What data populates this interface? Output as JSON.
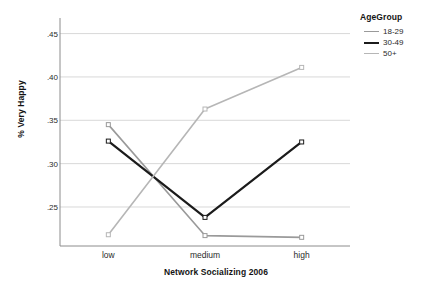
{
  "chart_data": {
    "type": "line",
    "title": "",
    "xlabel": "Network Socializing 2006",
    "ylabel": "% Very Happy",
    "categories": [
      "low",
      "medium",
      "high"
    ],
    "ylim": [
      0.205,
      0.468
    ],
    "yticks": [
      ".25",
      ".30",
      ".35",
      ".40",
      ".45"
    ],
    "ytick_values": [
      0.25,
      0.3,
      0.35,
      0.4,
      0.45
    ],
    "grid": true,
    "legend_position": "top-right",
    "legend_title": "AgeGroup",
    "series": [
      {
        "name": "18-29",
        "values": [
          0.345,
          0.217,
          0.215
        ],
        "color": "#9a9a9a",
        "width": 1.6,
        "marker": "square"
      },
      {
        "name": "30-49",
        "values": [
          0.326,
          0.238,
          0.325
        ],
        "color": "#1b1b1b",
        "width": 2.2,
        "marker": "square"
      },
      {
        "name": "50+",
        "values": [
          0.218,
          0.363,
          0.411
        ],
        "color": "#b6b6b6",
        "width": 1.6,
        "marker": "square"
      }
    ]
  },
  "axis": {
    "line_color": "#8c8c8c",
    "grid_color": "#d8d8d8"
  }
}
